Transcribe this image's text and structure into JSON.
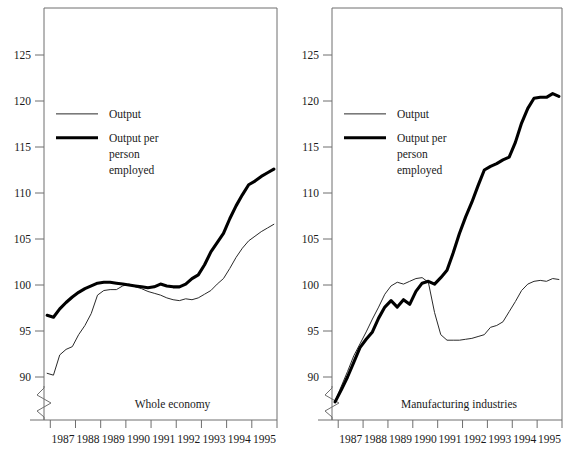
{
  "figure": {
    "background": "#ffffff",
    "ink": "#1a1a1a",
    "frame_color": "#6e6e6e"
  },
  "chart_data": [
    {
      "type": "line",
      "title": "Whole economy",
      "panel": "left",
      "xlabel": "",
      "ylabel": "",
      "xlim": [
        1986.75,
        1996.0
      ],
      "ylim": [
        88.0,
        128.5
      ],
      "ylim_note": "y axis broken below 90",
      "grid": false,
      "axis_break": true,
      "legend_position": "upper-left",
      "ticklabels_y": [
        "90",
        "95",
        "100",
        "105",
        "110",
        "115",
        "120",
        "125"
      ],
      "yticks": [
        90,
        95,
        100,
        105,
        110,
        115,
        120,
        125
      ],
      "ticklabels_x": [
        "1987",
        "1988",
        "1989",
        "1990",
        "1991",
        "1992",
        "1993",
        "1994",
        "1995"
      ],
      "xtick_years": [
        1987,
        1988,
        1989,
        1990,
        1991,
        1992,
        1993,
        1994,
        1995
      ],
      "x": [
        1986.875,
        1987.125,
        1987.375,
        1987.625,
        1987.875,
        1988.125,
        1988.375,
        1988.625,
        1988.875,
        1989.125,
        1989.375,
        1989.625,
        1989.875,
        1990.125,
        1990.375,
        1990.625,
        1990.875,
        1991.125,
        1991.375,
        1991.625,
        1991.875,
        1992.125,
        1992.375,
        1992.625,
        1992.875,
        1993.125,
        1993.375,
        1993.625,
        1993.875,
        1994.125,
        1994.375,
        1994.625,
        1994.875,
        1995.125,
        1995.375,
        1995.625,
        1995.875
      ],
      "series": [
        {
          "name": "Output",
          "style": "thin",
          "values": [
            90.4,
            90.2,
            92.4,
            93.0,
            93.3,
            94.6,
            95.6,
            96.9,
            98.9,
            99.4,
            99.5,
            99.5,
            99.9,
            100.1,
            99.8,
            99.6,
            99.3,
            99.1,
            98.9,
            98.6,
            98.4,
            98.3,
            98.5,
            98.4,
            98.6,
            99.0,
            99.4,
            100.1,
            100.7,
            101.8,
            103.0,
            104.0,
            104.8,
            105.3,
            105.8,
            106.2,
            106.6
          ]
        },
        {
          "name": "Output per person employed",
          "style": "thick",
          "values": [
            96.7,
            96.5,
            97.4,
            98.1,
            98.7,
            99.2,
            99.6,
            99.9,
            100.2,
            100.3,
            100.3,
            100.2,
            100.1,
            100.0,
            99.9,
            99.8,
            99.7,
            99.8,
            100.1,
            99.9,
            99.8,
            99.8,
            100.1,
            100.7,
            101.1,
            102.2,
            103.6,
            104.6,
            105.6,
            107.2,
            108.6,
            109.8,
            110.9,
            111.3,
            111.8,
            112.2,
            112.6
          ]
        }
      ]
    },
    {
      "type": "line",
      "title": "Manufacturing industries",
      "panel": "right",
      "xlabel": "",
      "ylabel": "",
      "xlim": [
        1986.75,
        1996.0
      ],
      "ylim": [
        88.0,
        128.5
      ],
      "ylim_note": "y axis broken below 90",
      "grid": false,
      "axis_break": true,
      "legend_position": "upper-left",
      "ticklabels_y": [
        "90",
        "95",
        "100",
        "105",
        "110",
        "115",
        "120",
        "125"
      ],
      "yticks": [
        90,
        95,
        100,
        105,
        110,
        115,
        120,
        125
      ],
      "ticklabels_x": [
        "1987",
        "1988",
        "1989",
        "1990",
        "1991",
        "1992",
        "1993",
        "1994",
        "1995"
      ],
      "xtick_years": [
        1987,
        1988,
        1989,
        1990,
        1991,
        1992,
        1993,
        1994,
        1995
      ],
      "x": [
        1986.875,
        1987.125,
        1987.375,
        1987.625,
        1987.875,
        1988.125,
        1988.375,
        1988.625,
        1988.875,
        1989.125,
        1989.375,
        1989.625,
        1989.875,
        1990.125,
        1990.375,
        1990.625,
        1990.875,
        1991.125,
        1991.375,
        1991.625,
        1991.875,
        1992.125,
        1992.375,
        1992.625,
        1992.875,
        1993.125,
        1993.375,
        1993.625,
        1993.875,
        1994.125,
        1994.375,
        1994.625,
        1994.875,
        1995.125,
        1995.375,
        1995.625,
        1995.875
      ],
      "series": [
        {
          "name": "Output",
          "style": "thin",
          "values": [
            87.4,
            89.0,
            90.6,
            92.3,
            93.6,
            94.9,
            96.3,
            97.6,
            99.0,
            99.9,
            100.3,
            100.1,
            100.4,
            100.7,
            100.8,
            100.3,
            97.0,
            94.6,
            94.0,
            94.0,
            94.0,
            94.1,
            94.2,
            94.4,
            94.6,
            95.4,
            95.6,
            96.0,
            97.1,
            98.2,
            99.4,
            100.1,
            100.4,
            100.5,
            100.4,
            100.7,
            100.6
          ]
        },
        {
          "name": "Output per person employed",
          "style": "thick",
          "values": [
            87.3,
            88.6,
            90.0,
            91.6,
            93.2,
            94.1,
            94.9,
            96.4,
            97.6,
            98.3,
            97.6,
            98.4,
            97.9,
            99.3,
            100.2,
            100.4,
            100.1,
            100.8,
            101.6,
            103.5,
            105.6,
            107.4,
            109.0,
            110.8,
            112.5,
            112.9,
            113.2,
            113.6,
            113.9,
            115.5,
            117.6,
            119.2,
            120.3,
            120.4,
            120.4,
            120.8,
            120.5
          ]
        }
      ]
    }
  ],
  "legend": {
    "entries": [
      {
        "label": "Output",
        "style": "thin"
      },
      {
        "label": "Output per",
        "label_line2": "person",
        "label_line3": "employed",
        "style": "thick"
      }
    ],
    "thin_label": "Output",
    "thick_label_line1": "Output per",
    "thick_label_line2": "person",
    "thick_label_line3": "employed"
  },
  "panels": {
    "left_caption": "Whole economy",
    "right_caption": "Manufacturing industries"
  }
}
